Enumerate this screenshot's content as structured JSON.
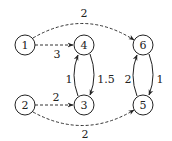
{
  "diagram": {
    "type": "directed-graph",
    "nodes": [
      {
        "id": "1",
        "label": "1",
        "x": 25,
        "y": 45
      },
      {
        "id": "4",
        "label": "4",
        "x": 84,
        "y": 45
      },
      {
        "id": "6",
        "label": "6",
        "x": 143,
        "y": 45
      },
      {
        "id": "2",
        "label": "2",
        "x": 25,
        "y": 105
      },
      {
        "id": "3",
        "label": "3",
        "x": 84,
        "y": 105
      },
      {
        "id": "5",
        "label": "5",
        "x": 143,
        "y": 105
      }
    ],
    "edges": [
      {
        "from": "1",
        "to": "6",
        "label": "2",
        "style": "dashed"
      },
      {
        "from": "1",
        "to": "4",
        "label": "3",
        "style": "dashed"
      },
      {
        "from": "2",
        "to": "3",
        "label": "2",
        "style": "dashed"
      },
      {
        "from": "2",
        "to": "5",
        "label": "2",
        "style": "dashed"
      },
      {
        "from": "3",
        "to": "4",
        "label": "1",
        "style": "solid"
      },
      {
        "from": "4",
        "to": "3",
        "label": "1.5",
        "style": "solid"
      },
      {
        "from": "5",
        "to": "6",
        "label": "2",
        "style": "solid"
      },
      {
        "from": "6",
        "to": "5",
        "label": "1",
        "style": "solid"
      }
    ]
  }
}
